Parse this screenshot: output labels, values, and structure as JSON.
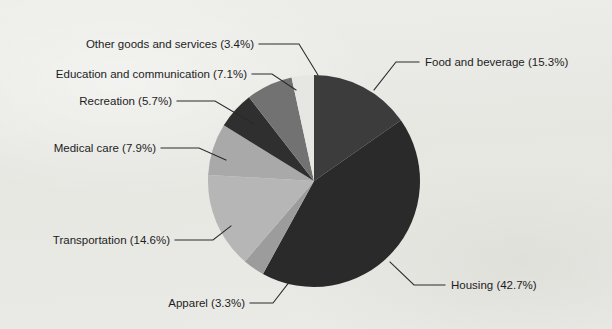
{
  "chart_data": {
    "type": "pie",
    "title": "",
    "subtitle": "",
    "xlabel": "",
    "ylabel": "",
    "legend_position": "none",
    "label_format": "name (percent%)",
    "start_angle_deg": 0,
    "direction": "clockwise",
    "categories": [
      "Food and beverage",
      "Housing",
      "Apparel",
      "Transportation",
      "Medical care",
      "Recreation",
      "Education and communication",
      "Other goods and services"
    ],
    "values": [
      15.3,
      42.7,
      3.3,
      14.6,
      7.9,
      5.7,
      7.1,
      3.4
    ],
    "units": "percent",
    "total": 100.0,
    "slices": [
      {
        "name": "Food and beverage",
        "value": 15.3,
        "label": "Food and beverage (15.3%)",
        "color": "#3c3c3c",
        "start_deg": 0.0,
        "end_deg": 55.08,
        "label_side": "right"
      },
      {
        "name": "Housing",
        "value": 42.7,
        "label": "Housing (42.7%)",
        "color": "#2a2a2a",
        "start_deg": 55.08,
        "end_deg": 208.8,
        "label_side": "right"
      },
      {
        "name": "Apparel",
        "value": 3.3,
        "label": "Apparel (3.3%)",
        "color": "#9c9c9c",
        "start_deg": 208.8,
        "end_deg": 220.68,
        "label_side": "left"
      },
      {
        "name": "Transportation",
        "value": 14.6,
        "label": "Transportation (14.6%)",
        "color": "#b6b6b6",
        "start_deg": 220.68,
        "end_deg": 273.24,
        "label_side": "left"
      },
      {
        "name": "Medical care",
        "value": 7.9,
        "label": "Medical care (7.9%)",
        "color": "#a9a9a9",
        "start_deg": 273.24,
        "end_deg": 301.68,
        "label_side": "left"
      },
      {
        "name": "Recreation",
        "value": 5.7,
        "label": "Recreation (5.7%)",
        "color": "#2f2f2f",
        "start_deg": 301.68,
        "end_deg": 322.2,
        "label_side": "left"
      },
      {
        "name": "Education and communication",
        "value": 7.1,
        "label": "Education and communication (7.1%)",
        "color": "#727272",
        "start_deg": 322.2,
        "end_deg": 347.76,
        "label_side": "left"
      },
      {
        "name": "Other goods and services",
        "value": 3.4,
        "label": "Other goods and services (3.4%)",
        "color": "#e6e6e2",
        "start_deg": 347.76,
        "end_deg": 360.0,
        "label_side": "left"
      }
    ],
    "geometry": {
      "center_x": 314,
      "center_y": 181,
      "radius": 106
    },
    "background_color": "#e9e9e5",
    "text_color": "#1d1d1d"
  },
  "labels": {
    "other_goods": "Other goods and services (3.4%)",
    "education": "Education and communication (7.1%)",
    "recreation": "Recreation (5.7%)",
    "medical": "Medical care (7.9%)",
    "transportation": "Transportation (14.6%)",
    "apparel": "Apparel (3.3%)",
    "food": "Food and beverage (15.3%)",
    "housing": "Housing (42.7%)"
  }
}
